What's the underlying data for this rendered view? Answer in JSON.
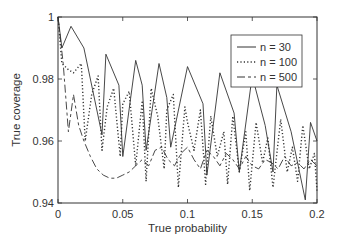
{
  "chart_data": {
    "type": "line",
    "title": "",
    "xlabel": "True probability",
    "ylabel": "True coverage",
    "xlim": [
      0,
      0.2
    ],
    "ylim": [
      0.94,
      1.0
    ],
    "xticks": [
      0,
      0.05,
      0.1,
      0.15,
      0.2
    ],
    "xtick_labels": [
      "0",
      "0.05",
      "0.1",
      "0.15",
      "0.2"
    ],
    "yticks": [
      0.94,
      0.96,
      0.98,
      1.0
    ],
    "ytick_labels": [
      "0.94",
      "0.96",
      "0.98",
      "1"
    ],
    "grid": false,
    "legend_position": "upper right",
    "series": [
      {
        "name": "n = 30",
        "style": "solid",
        "x": [
          0,
          0.003,
          0.01,
          0.02,
          0.034,
          0.037,
          0.047,
          0.05,
          0.06,
          0.065,
          0.068,
          0.078,
          0.084,
          0.087,
          0.1,
          0.112,
          0.115,
          0.125,
          0.136,
          0.14,
          0.15,
          0.16,
          0.166,
          0.169,
          0.18,
          0.191,
          0.195,
          0.2
        ],
        "y": [
          1.0,
          0.99,
          0.997,
          0.99,
          0.962,
          0.988,
          0.978,
          0.955,
          0.986,
          0.978,
          0.957,
          0.985,
          0.974,
          0.958,
          0.984,
          0.972,
          0.949,
          0.982,
          0.969,
          0.95,
          0.981,
          0.965,
          0.95,
          0.978,
          0.963,
          0.941,
          0.966,
          0.96
        ]
      },
      {
        "name": "n = 100",
        "style": "dotted",
        "x": [
          0,
          0.003,
          0.008,
          0.012,
          0.018,
          0.021,
          0.026,
          0.031,
          0.034,
          0.038,
          0.043,
          0.048,
          0.05,
          0.055,
          0.06,
          0.065,
          0.068,
          0.072,
          0.077,
          0.082,
          0.084,
          0.089,
          0.093,
          0.098,
          0.1,
          0.105,
          0.11,
          0.114,
          0.118,
          0.123,
          0.128,
          0.131,
          0.135,
          0.14,
          0.145,
          0.148,
          0.153,
          0.158,
          0.162,
          0.166,
          0.172,
          0.177,
          0.181,
          0.185,
          0.189,
          0.194,
          0.198,
          0.2
        ],
        "y": [
          1.0,
          0.985,
          0.983,
          0.982,
          0.985,
          0.96,
          0.975,
          0.981,
          0.957,
          0.971,
          0.977,
          0.955,
          0.972,
          0.976,
          0.952,
          0.973,
          0.947,
          0.977,
          0.968,
          0.951,
          0.97,
          0.975,
          0.945,
          0.971,
          0.966,
          0.957,
          0.97,
          0.946,
          0.968,
          0.955,
          0.963,
          0.946,
          0.968,
          0.95,
          0.963,
          0.944,
          0.966,
          0.953,
          0.961,
          0.945,
          0.967,
          0.95,
          0.958,
          0.947,
          0.965,
          0.951,
          0.956,
          0.944
        ]
      },
      {
        "name": "n = 500",
        "style": "dashed",
        "x": [
          0,
          0.004,
          0.008,
          0.012,
          0.016,
          0.02,
          0.025,
          0.03,
          0.035,
          0.04,
          0.045,
          0.05,
          0.055,
          0.06,
          0.065,
          0.07,
          0.075,
          0.08,
          0.085,
          0.09,
          0.095,
          0.1,
          0.105,
          0.11,
          0.115,
          0.12,
          0.125,
          0.13,
          0.135,
          0.14,
          0.145,
          0.15,
          0.155,
          0.16,
          0.165,
          0.17,
          0.175,
          0.18,
          0.185,
          0.19,
          0.195,
          0.2
        ],
        "y": [
          1.0,
          0.985,
          0.963,
          0.975,
          0.965,
          0.96,
          0.955,
          0.951,
          0.949,
          0.948,
          0.948,
          0.949,
          0.95,
          0.952,
          0.954,
          0.952,
          0.957,
          0.958,
          0.954,
          0.952,
          0.956,
          0.958,
          0.954,
          0.951,
          0.957,
          0.955,
          0.952,
          0.956,
          0.954,
          0.951,
          0.955,
          0.952,
          0.951,
          0.954,
          0.953,
          0.951,
          0.955,
          0.952,
          0.953,
          0.951,
          0.954,
          0.952
        ]
      }
    ]
  },
  "legend": {
    "items": [
      "n = 30",
      "n = 100",
      "n = 500"
    ]
  },
  "axes": {
    "xlabel": "True probability",
    "ylabel": "True coverage"
  }
}
